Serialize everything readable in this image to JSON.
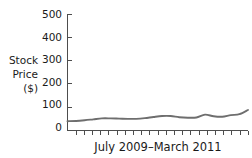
{
  "chart_data": {
    "type": "line",
    "title": "",
    "xlabel": "July 2009–March 2011",
    "ylabel": "Stock Price ($)",
    "ylabel_lines": [
      "Stock",
      "Price",
      "($)"
    ],
    "ylim": [
      0,
      500
    ],
    "yticks": [
      0,
      100,
      200,
      300,
      400,
      500
    ],
    "ytick_labels": [
      "0",
      "100",
      "200",
      "300",
      "400",
      "500"
    ],
    "grid": false,
    "legend": null,
    "x_tick_count": 22,
    "x_tick_labels_shown": false,
    "series": [
      {
        "name": "Stock Price",
        "color": "#6e6e6e",
        "x": [
          0,
          1,
          2,
          3,
          4,
          5,
          6,
          7,
          8,
          9,
          10,
          11,
          12,
          13,
          14,
          15,
          16,
          17,
          18,
          19,
          20,
          21
        ],
        "values": [
          40,
          41,
          44,
          48,
          52,
          52,
          51,
          50,
          50,
          53,
          58,
          62,
          62,
          57,
          55,
          56,
          68,
          61,
          59,
          66,
          70,
          88
        ]
      }
    ]
  },
  "chart": {
    "axis_color": "#4d4d4d",
    "line_color": "#6e6e6e",
    "background": "#ffffff"
  }
}
